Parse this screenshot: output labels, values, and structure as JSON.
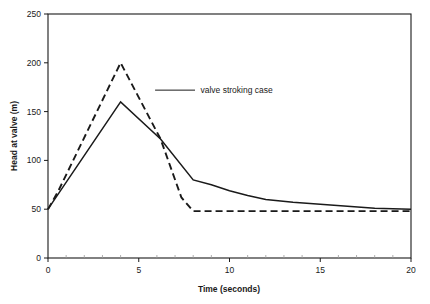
{
  "chart_data": {
    "type": "line",
    "title": "",
    "xlabel": "Time (seconds)",
    "ylabel": "Head at valve (m)",
    "xlim": [
      0,
      20
    ],
    "ylim": [
      0,
      250
    ],
    "xticks": [
      0,
      5,
      10,
      15,
      20
    ],
    "yticks": [
      0,
      50,
      100,
      150,
      200,
      250
    ],
    "xtick_labels": [
      "0",
      "5",
      "10",
      "15",
      "20"
    ],
    "ytick_labels": [
      "0",
      "50",
      "100",
      "150",
      "200",
      "250"
    ],
    "x_minor_tick_step": 1,
    "grid": false,
    "legend": "none",
    "annotations": [
      {
        "text": "valve stroking case",
        "text_x": 8.4,
        "text_y": 172,
        "leader_from_x": 5.9,
        "leader_from_y": 172,
        "leader_to_x": 8.1,
        "leader_to_y": 172
      }
    ],
    "series": [
      {
        "name": "valve stroking case",
        "style": "dashed",
        "color": "#1a1a1a",
        "x": [
          0,
          0.55,
          4.0,
          6.2,
          7.35,
          8.0,
          20.0
        ],
        "values": [
          50,
          68,
          200,
          122,
          62,
          48,
          48
        ]
      },
      {
        "name": "base case",
        "style": "solid",
        "color": "#1a1a1a",
        "x": [
          0,
          4.0,
          6.2,
          8.0,
          9.0,
          10.0,
          11.0,
          12.0,
          13.5,
          15.0,
          16.5,
          18.0,
          20.0
        ],
        "values": [
          50,
          160,
          122,
          80,
          75,
          69,
          64,
          60,
          57,
          55,
          53,
          51,
          50
        ]
      }
    ]
  }
}
